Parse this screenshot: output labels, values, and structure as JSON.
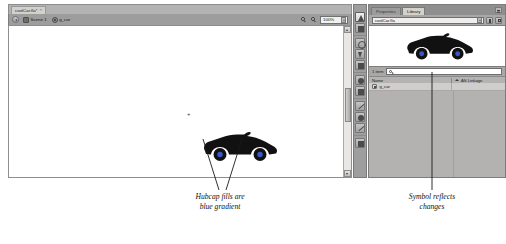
{
  "app": {
    "name": "flash-authoring",
    "document_tab": {
      "label": "coolCar.fla*",
      "close_glyph": "×"
    },
    "edit_bar": {
      "back_label": "Back",
      "breadcrumb": [
        {
          "label": "Scene 1",
          "icon": "scene-icon"
        },
        {
          "label": "g_car",
          "icon": "symbol-icon"
        }
      ],
      "zoom_value": "100%",
      "zoom_tools": [
        "zoom-in-icon",
        "zoom-out-icon"
      ]
    },
    "stage": {
      "registration_mark": "+",
      "artwork_name": "car-silhouette"
    },
    "tools": {
      "items": [
        {
          "name": "selection-tool",
          "glyph": "arrow"
        },
        {
          "name": "subselection-tool",
          "glyph": "arrow-outline"
        },
        {
          "name": "free-transform-tool",
          "glyph": "square"
        },
        {
          "name": "lasso-tool",
          "glyph": "lasso"
        },
        {
          "name": "pen-tool",
          "glyph": "pen"
        },
        {
          "name": "text-tool",
          "glyph": "text"
        },
        {
          "name": "oval-tool",
          "glyph": "circle"
        },
        {
          "name": "rectangle-tool",
          "glyph": "square"
        },
        {
          "name": "pencil-tool",
          "glyph": "pencil"
        },
        {
          "name": "brush-tool",
          "glyph": "brush"
        },
        {
          "name": "ink-bottle-tool",
          "glyph": "ink"
        },
        {
          "name": "paint-bucket-tool",
          "glyph": "bucket"
        },
        {
          "name": "eyedropper-tool",
          "glyph": "dropper"
        },
        {
          "name": "eraser-tool",
          "glyph": "eraser"
        },
        {
          "name": "hand-tool",
          "glyph": "hand"
        }
      ]
    },
    "panel": {
      "tabs": [
        {
          "label": "Properties",
          "active": false
        },
        {
          "label": "Library",
          "active": true
        }
      ],
      "menu_icon": "panel-menu-icon",
      "library": {
        "document_select": "coolCar.fla",
        "pin_button": "pin-icon",
        "new_library_button": "new-library-panel-icon",
        "item_count": "1 item",
        "search_placeholder": "",
        "columns": [
          "Name",
          "AS Linkage"
        ],
        "rows": [
          {
            "name": "g_car",
            "icon": "movieclip-symbol-icon",
            "linkage": ""
          }
        ]
      }
    }
  },
  "annotations": [
    {
      "name": "hubcap-note",
      "line1": "Hubcap fills are",
      "line2": "blue gradient"
    },
    {
      "name": "symbol-note",
      "line1": "Symbol reflects",
      "line2": "changes"
    }
  ],
  "colors": {
    "chrome_gray": "#9e9e9e",
    "panel_gray": "#a8a8a8",
    "stage_white": "#ffffff",
    "artwork_black": "#111111",
    "tab_active": "#d4d2cf"
  }
}
